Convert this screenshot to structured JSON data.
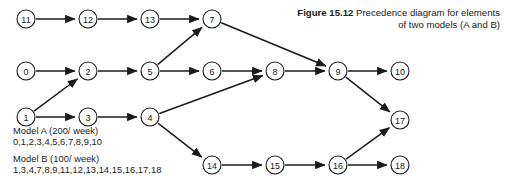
{
  "figure": {
    "caption_number": "Figure 15.12",
    "caption_text": "Precedence diagram for elements of two models (A and B)"
  },
  "legend": {
    "model_a_title": "Model A (200/ week)",
    "model_a_elements": "0,1,2,3,4,5,6,7,8,9,10",
    "model_b_title": "Model B (100/ week)",
    "model_b_elements": "1,3,4,7,8,9,11,12,13,14,15,16,17,18"
  },
  "colors": {
    "ink": "#1a1a1a",
    "background": "#ffffff"
  },
  "chart_data": {
    "type": "diagram",
    "title": "Precedence diagram for elements of two models (A and B)",
    "nodes": [
      {
        "id": "11",
        "label": "11",
        "x": 26,
        "y": 19
      },
      {
        "id": "12",
        "label": "12",
        "x": 88,
        "y": 19
      },
      {
        "id": "13",
        "label": "13",
        "x": 150,
        "y": 19
      },
      {
        "id": "7",
        "label": "7",
        "x": 212,
        "y": 19
      },
      {
        "id": "0",
        "label": "0",
        "x": 26,
        "y": 71
      },
      {
        "id": "2",
        "label": "2",
        "x": 88,
        "y": 71
      },
      {
        "id": "5",
        "label": "5",
        "x": 150,
        "y": 71
      },
      {
        "id": "6",
        "label": "6",
        "x": 212,
        "y": 71
      },
      {
        "id": "8",
        "label": "8",
        "x": 275,
        "y": 71
      },
      {
        "id": "9",
        "label": "9",
        "x": 338,
        "y": 71
      },
      {
        "id": "10",
        "label": "10",
        "x": 400,
        "y": 71
      },
      {
        "id": "1",
        "label": "1",
        "x": 26,
        "y": 117
      },
      {
        "id": "3",
        "label": "3",
        "x": 88,
        "y": 117
      },
      {
        "id": "4",
        "label": "4",
        "x": 150,
        "y": 117
      },
      {
        "id": "17",
        "label": "17",
        "x": 400,
        "y": 120
      },
      {
        "id": "14",
        "label": "14",
        "x": 212,
        "y": 165
      },
      {
        "id": "15",
        "label": "15",
        "x": 275,
        "y": 165
      },
      {
        "id": "16",
        "label": "16",
        "x": 338,
        "y": 165
      },
      {
        "id": "18",
        "label": "18",
        "x": 400,
        "y": 165
      }
    ],
    "node_radius": 9,
    "edges": [
      {
        "from": "11",
        "to": "12"
      },
      {
        "from": "12",
        "to": "13"
      },
      {
        "from": "13",
        "to": "7"
      },
      {
        "from": "0",
        "to": "2"
      },
      {
        "from": "1",
        "to": "2"
      },
      {
        "from": "2",
        "to": "5"
      },
      {
        "from": "5",
        "to": "6"
      },
      {
        "from": "5",
        "to": "7"
      },
      {
        "from": "6",
        "to": "8"
      },
      {
        "from": "7",
        "to": "9"
      },
      {
        "from": "8",
        "to": "9"
      },
      {
        "from": "9",
        "to": "10"
      },
      {
        "from": "9",
        "to": "17"
      },
      {
        "from": "1",
        "to": "3"
      },
      {
        "from": "3",
        "to": "4"
      },
      {
        "from": "4",
        "to": "8"
      },
      {
        "from": "4",
        "to": "14"
      },
      {
        "from": "14",
        "to": "15"
      },
      {
        "from": "15",
        "to": "16"
      },
      {
        "from": "16",
        "to": "18"
      },
      {
        "from": "16",
        "to": "17"
      }
    ]
  }
}
